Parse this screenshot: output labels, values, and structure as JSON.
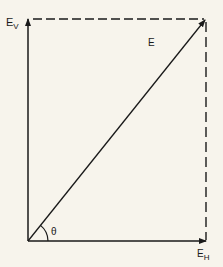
{
  "diagram": {
    "labels": {
      "vertical": {
        "main": "E",
        "sub": "V"
      },
      "horizontal": {
        "main": "E",
        "sub": "H"
      },
      "resultant": "E",
      "angle": "θ"
    },
    "colors": {
      "background": "#f7f4ec",
      "stroke": "#1a1a1a"
    }
  }
}
